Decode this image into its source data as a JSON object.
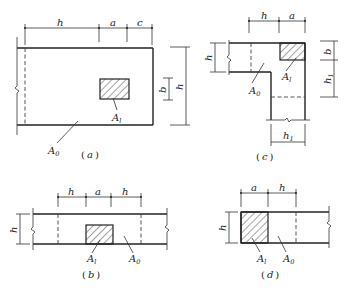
{
  "figure": {
    "panels": [
      {
        "id": "a",
        "caption": "(a)",
        "caption_letter": "a",
        "top_dimensions": [
          "h",
          "a",
          "c"
        ],
        "side_dimensions": [
          "b",
          "h"
        ],
        "areas": {
          "bearing": "A",
          "bearing_sub": "l",
          "effective": "A",
          "effective_sub": "0"
        }
      },
      {
        "id": "b",
        "caption": "(b)",
        "caption_letter": "b",
        "top_dimensions": [
          "h",
          "a",
          "h"
        ],
        "side_dimensions": [
          "h"
        ],
        "areas": {
          "bearing": "A",
          "bearing_sub": "l",
          "effective": "A",
          "effective_sub": "0"
        }
      },
      {
        "id": "c",
        "caption": "(c)",
        "caption_letter": "c",
        "top_dimensions": [
          "h",
          "a"
        ],
        "left_dimensions": [
          "h"
        ],
        "right_dimensions": [
          "b",
          "h1"
        ],
        "bottom_dimensions": [
          "h1"
        ],
        "areas": {
          "bearing": "A",
          "bearing_sub": "l",
          "effective": "A",
          "effective_sub": "0"
        }
      },
      {
        "id": "d",
        "caption": "(d)",
        "caption_letter": "d",
        "top_dimensions": [
          "a",
          "h"
        ],
        "side_dimensions": [
          "h"
        ],
        "areas": {
          "bearing": "A",
          "bearing_sub": "l",
          "effective": "A",
          "effective_sub": "0"
        }
      }
    ],
    "labels": {
      "h": "h",
      "a": "a",
      "b": "b",
      "c": "c",
      "h1_main": "h",
      "h1_sub": "1",
      "paren_open": "(",
      "paren_close": ")"
    },
    "colors": {
      "line": "#222222",
      "background": "#ffffff",
      "hatch": "#333333"
    }
  }
}
